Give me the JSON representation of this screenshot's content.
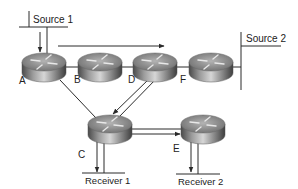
{
  "diagram": {
    "type": "multicast-network-topology",
    "sources": [
      {
        "id": "source1",
        "label": "Source 1"
      },
      {
        "id": "source2",
        "label": "Source 2"
      }
    ],
    "receivers": [
      {
        "id": "receiver1",
        "label": "Receiver 1"
      },
      {
        "id": "receiver2",
        "label": "Receiver 2"
      }
    ],
    "routers": [
      {
        "id": "A",
        "label": "A"
      },
      {
        "id": "B",
        "label": "B"
      },
      {
        "id": "D",
        "label": "D"
      },
      {
        "id": "F",
        "label": "F"
      },
      {
        "id": "C",
        "label": "C"
      },
      {
        "id": "E",
        "label": "E"
      }
    ],
    "links": [
      {
        "from": "source1",
        "to": "A"
      },
      {
        "from": "A",
        "to": "B"
      },
      {
        "from": "B",
        "to": "D"
      },
      {
        "from": "D",
        "to": "F"
      },
      {
        "from": "F",
        "to": "source2"
      },
      {
        "from": "A",
        "to": "C"
      },
      {
        "from": "D",
        "to": "C"
      },
      {
        "from": "C",
        "to": "E"
      },
      {
        "from": "C",
        "to": "receiver1"
      },
      {
        "from": "E",
        "to": "receiver2"
      }
    ],
    "flows": [
      {
        "path": [
          "source1",
          "A"
        ],
        "direction": "down"
      },
      {
        "path": [
          "A",
          "D"
        ],
        "direction": "right",
        "note": "arrow over A-B-D"
      },
      {
        "path": [
          "D",
          "C"
        ],
        "direction": "down-left"
      },
      {
        "path": [
          "C",
          "E"
        ],
        "direction": "right"
      },
      {
        "path": [
          "C",
          "receiver1"
        ],
        "direction": "down"
      },
      {
        "path": [
          "E",
          "receiver2"
        ],
        "direction": "down"
      }
    ],
    "colors": {
      "line": "#2a2a2a",
      "router_top": "#9a9a9a",
      "router_side_dark": "#5a5a5a",
      "router_side_light": "#c8c8c8",
      "background": "#ffffff"
    }
  }
}
